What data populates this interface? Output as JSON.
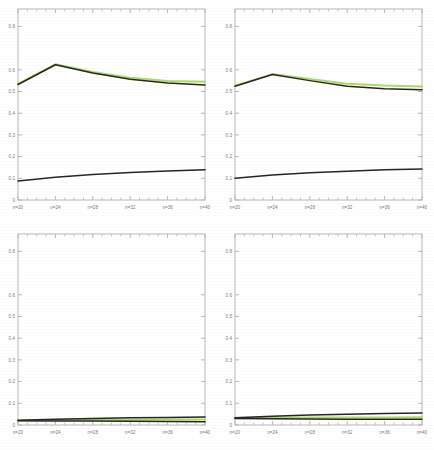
{
  "figure": {
    "layout": "2x2 grid of line plots",
    "background_color": "#ffffff",
    "panel_count": 4
  },
  "style": {
    "axis_color": "#b9b9b9",
    "tick_label_color": "#7b7b7b",
    "series_dark_color": "#262626",
    "series_green_color": "#a9d957",
    "series_olive_color": "#7f9a3c"
  },
  "axes": {
    "y_ticks": [
      "0",
      "0.1",
      "0.2",
      "0.3",
      "0.4",
      "0.5",
      "0.6",
      "0.8"
    ],
    "y_tick_values": [
      0,
      0.1,
      0.2,
      0.3,
      0.4,
      0.5,
      0.6,
      0.8
    ],
    "y_min": 0,
    "y_max": 0.88,
    "x_ticks": [
      "n=20",
      "n=24",
      "n=28",
      "n=32",
      "n=36",
      "n=40"
    ],
    "x_tick_values": [
      20,
      24,
      28,
      32,
      36,
      40
    ],
    "x_min": 20,
    "x_max": 40,
    "minor_ticks_per_interval": 3,
    "grid": "off",
    "legend": "none",
    "title": "",
    "xlabel": "",
    "ylabel": ""
  },
  "chart_data": [
    {
      "id": "panel-top-left",
      "type": "line",
      "title": "",
      "xlabel": "",
      "ylabel": "",
      "grid": false,
      "legend": "none",
      "xlim": [
        20,
        40
      ],
      "ylim": [
        0,
        0.88
      ],
      "categories": [
        "n=20",
        "n=24",
        "n=28",
        "n=32",
        "n=36",
        "n=40"
      ],
      "x": [
        20,
        24,
        28,
        32,
        36,
        40
      ],
      "series": [
        {
          "name": "upper-green",
          "color": "#a9d957",
          "values": [
            0.535,
            0.625,
            0.59,
            0.563,
            0.548,
            0.545
          ]
        },
        {
          "name": "upper-dark",
          "color": "#262626",
          "values": [
            0.532,
            0.623,
            0.585,
            0.556,
            0.539,
            0.53
          ]
        },
        {
          "name": "lower-dark",
          "color": "#262626",
          "values": [
            0.088,
            0.105,
            0.118,
            0.127,
            0.134,
            0.139
          ]
        }
      ]
    },
    {
      "id": "panel-top-right",
      "type": "line",
      "title": "",
      "xlabel": "",
      "ylabel": "",
      "grid": false,
      "legend": "none",
      "xlim": [
        20,
        40
      ],
      "ylim": [
        0,
        0.88
      ],
      "categories": [
        "n=20",
        "n=24",
        "n=28",
        "n=32",
        "n=36",
        "n=40"
      ],
      "x": [
        20,
        24,
        28,
        32,
        36,
        40
      ],
      "series": [
        {
          "name": "upper-green",
          "color": "#a9d957",
          "values": [
            0.527,
            0.58,
            0.558,
            0.536,
            0.527,
            0.523
          ]
        },
        {
          "name": "upper-dark",
          "color": "#262626",
          "values": [
            0.524,
            0.578,
            0.55,
            0.524,
            0.513,
            0.508
          ]
        },
        {
          "name": "lower-dark",
          "color": "#262626",
          "values": [
            0.1,
            0.115,
            0.126,
            0.133,
            0.139,
            0.143
          ]
        }
      ]
    },
    {
      "id": "panel-bottom-left",
      "type": "line",
      "title": "",
      "xlabel": "",
      "ylabel": "",
      "grid": false,
      "legend": "none",
      "xlim": [
        20,
        40
      ],
      "ylim": [
        0,
        0.88
      ],
      "categories": [
        "n=20",
        "n=24",
        "n=28",
        "n=32",
        "n=36",
        "n=40"
      ],
      "x": [
        20,
        24,
        28,
        32,
        36,
        40
      ],
      "series": [
        {
          "name": "upper-dark",
          "color": "#262626",
          "values": [
            0.022,
            0.027,
            0.03,
            0.033,
            0.035,
            0.037
          ]
        },
        {
          "name": "middle-green",
          "color": "#a9d957",
          "values": [
            0.021,
            0.023,
            0.024,
            0.024,
            0.025,
            0.025
          ]
        },
        {
          "name": "lower-dark",
          "color": "#262626",
          "values": [
            0.02,
            0.019,
            0.018,
            0.017,
            0.016,
            0.015
          ]
        }
      ]
    },
    {
      "id": "panel-bottom-right",
      "type": "line",
      "title": "",
      "xlabel": "",
      "ylabel": "",
      "grid": false,
      "legend": "none",
      "xlim": [
        20,
        40
      ],
      "ylim": [
        0,
        0.88
      ],
      "categories": [
        "n=20",
        "n=24",
        "n=28",
        "n=32",
        "n=36",
        "n=40"
      ],
      "x": [
        20,
        24,
        28,
        32,
        36,
        40
      ],
      "series": [
        {
          "name": "upper-dark",
          "color": "#262626",
          "values": [
            0.033,
            0.04,
            0.046,
            0.05,
            0.053,
            0.055
          ]
        },
        {
          "name": "middle-green",
          "color": "#a9d957",
          "values": [
            0.031,
            0.033,
            0.034,
            0.035,
            0.035,
            0.036
          ]
        },
        {
          "name": "lower-dark",
          "color": "#262626",
          "values": [
            0.03,
            0.029,
            0.028,
            0.027,
            0.026,
            0.026
          ]
        }
      ]
    }
  ]
}
